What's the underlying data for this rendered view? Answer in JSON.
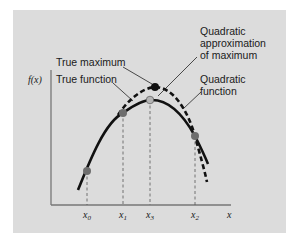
{
  "figure": {
    "background_color": "#dcdcdc",
    "axes": {
      "y_label": "f(x)",
      "x_label": "x",
      "x_ticks": [
        {
          "base": "x",
          "sub": "0"
        },
        {
          "base": "x",
          "sub": "1"
        },
        {
          "base": "x",
          "sub": "3"
        },
        {
          "base": "x",
          "sub": "2"
        }
      ]
    },
    "annotations": {
      "true_maximum": "True maximum",
      "true_function": "True function",
      "quad_approx_line1": "Quadratic",
      "quad_approx_line2": "approximation",
      "quad_approx_line3": "of maximum",
      "quad_function_line1": "Quadratic",
      "quad_function_line2": "function"
    },
    "colors": {
      "curve": "#111111",
      "point_fill": "#6e6e6e",
      "approx_point_fill": "#b5b5b5",
      "max_point_fill": "#111111",
      "axis": "#777777"
    }
  }
}
